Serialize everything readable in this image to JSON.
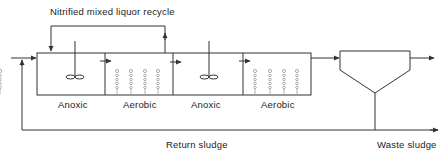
{
  "diagram": {
    "title_label": "Nitrified mixed liquor recycle",
    "zones": [
      {
        "label": "Anoxic",
        "type": "anoxic",
        "equipment": "mixer"
      },
      {
        "label": "Aerobic",
        "type": "aerobic",
        "equipment": "diffusers"
      },
      {
        "label": "Anoxic",
        "type": "anoxic",
        "equipment": "mixer"
      },
      {
        "label": "Aerobic",
        "type": "aerobic",
        "equipment": "diffusers"
      }
    ],
    "clarifier_label": "",
    "return_label": "Return sludge",
    "waste_label": "Waste sludge",
    "colors": {
      "line": "#333333",
      "text": "#222222",
      "bubble": "#9a9a9a"
    }
  }
}
